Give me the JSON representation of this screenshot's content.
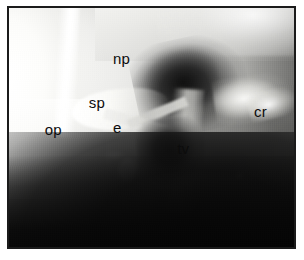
{
  "figure": {
    "kind": "lateral-radiograph",
    "modality": "plain-film radiograph",
    "orientation": "lateral",
    "frame_color": "#1b1b1b",
    "page_background": "#ffffff",
    "label_color": "#0c0c0c"
  },
  "annotations": [
    {
      "key": "np",
      "label": "np",
      "meaning": "nasopharynx",
      "x_pct": 36.5,
      "y_pct": 18.0,
      "tone": "light"
    },
    {
      "key": "sp",
      "label": "sp",
      "meaning": "soft palate",
      "x_pct": 28.0,
      "y_pct": 36.5,
      "tone": "light"
    },
    {
      "key": "op",
      "label": "op",
      "meaning": "oropharynx",
      "x_pct": 12.5,
      "y_pct": 47.5,
      "tone": "light"
    },
    {
      "key": "e",
      "label": "e",
      "meaning": "epiglottis",
      "x_pct": 36.5,
      "y_pct": 47.0,
      "tone": "light"
    },
    {
      "key": "tv",
      "label": "tv",
      "meaning": "true vocal cords",
      "x_pct": 59.0,
      "y_pct": 55.5,
      "tone": "dark"
    },
    {
      "key": "cr",
      "label": "cr",
      "meaning": "cricoid",
      "x_pct": 86.0,
      "y_pct": 40.0,
      "tone": "dark"
    }
  ]
}
